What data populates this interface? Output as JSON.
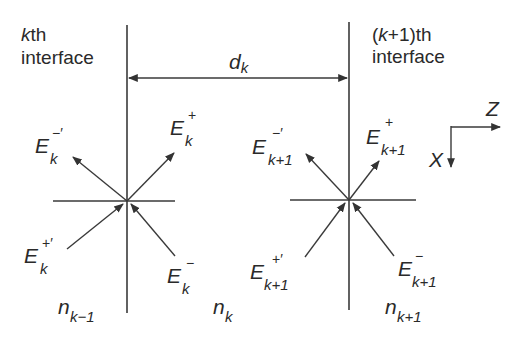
{
  "diagram": {
    "type": "thin-film multilayer field diagram",
    "interfaces": {
      "left": {
        "label_line1": "kth",
        "label_line1_italic_part": "k",
        "label_line1_rest": "th",
        "label_line2": "interface"
      },
      "right": {
        "label_line1": "(k+1)th",
        "label_line1_open": "(",
        "label_line1_italic_part": "k",
        "label_line1_rest": "+1)th",
        "label_line2": "interface"
      }
    },
    "thickness": {
      "symbol": "d",
      "subscript": "k"
    },
    "axes": {
      "horizontal": "Z",
      "vertical": "X"
    },
    "fields_left": [
      {
        "id": "E_k_minus_prime",
        "base": "E",
        "sub": "k",
        "sup": "−′"
      },
      {
        "id": "E_k_plus",
        "base": "E",
        "sub": "k",
        "sup": "+"
      },
      {
        "id": "E_k_plus_prime",
        "base": "E",
        "sub": "k",
        "sup": "+′"
      },
      {
        "id": "E_k_minus",
        "base": "E",
        "sub": "k",
        "sup": "−"
      }
    ],
    "fields_right": [
      {
        "id": "E_k1_minus_prime",
        "base": "E",
        "sub": "k+1",
        "sup": "−′"
      },
      {
        "id": "E_k1_plus",
        "base": "E",
        "sub": "k+1",
        "sup": "+"
      },
      {
        "id": "E_k1_plus_prime",
        "base": "E",
        "sub": "k+1",
        "sup": "+′"
      },
      {
        "id": "E_k1_minus",
        "base": "E",
        "sub": "k+1",
        "sup": "−"
      }
    ],
    "media": [
      {
        "base": "n",
        "sub": "k−1"
      },
      {
        "base": "n",
        "sub": "k"
      },
      {
        "base": "n",
        "sub": "k+1"
      }
    ],
    "colors": {
      "line": "#3a3a3a",
      "text": "#2a2a2a",
      "background": "#ffffff"
    }
  }
}
